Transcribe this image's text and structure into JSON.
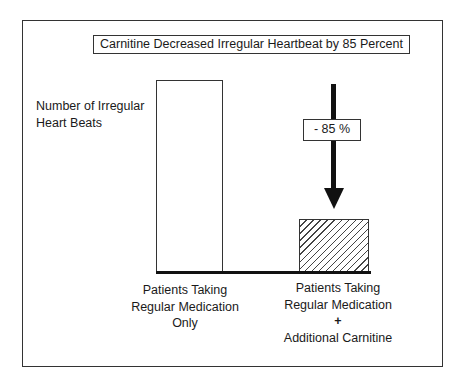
{
  "chart_data": {
    "type": "bar",
    "title": "Carnitine Decreased Irregular Heartbeat by 85 Percent",
    "ylabel": "Number of Irregular Heart Beats",
    "xlabel": "",
    "categories": [
      "Patients Taking Regular Medication Only",
      "Patients Taking Regular Medication + Additional Carnitine"
    ],
    "values": [
      100,
      28
    ],
    "value_units": "relative (no axis scale shown)",
    "annotation": {
      "text": "- 85 %",
      "type": "downward-arrow",
      "target_category": 1
    },
    "styles": [
      "white-fill",
      "diagonal-hatch"
    ],
    "axis_ticks": "none",
    "grid": false,
    "legend": "none"
  },
  "title": "Carnitine Decreased Irregular Heartbeat by 85 Percent",
  "y_axis_label": {
    "line1": "Number of Irregular",
    "line2": "Heart Beats"
  },
  "annotation_label": "- 85 %",
  "categories": [
    {
      "lines": [
        "Patients Taking",
        "Regular Medication",
        "Only"
      ]
    },
    {
      "lines": [
        "Patients Taking",
        "Regular Medication",
        "+",
        "Additional Carnitine"
      ]
    }
  ],
  "colors": {
    "line": "#111111",
    "background": "#ffffff",
    "hatch": "#444444"
  }
}
